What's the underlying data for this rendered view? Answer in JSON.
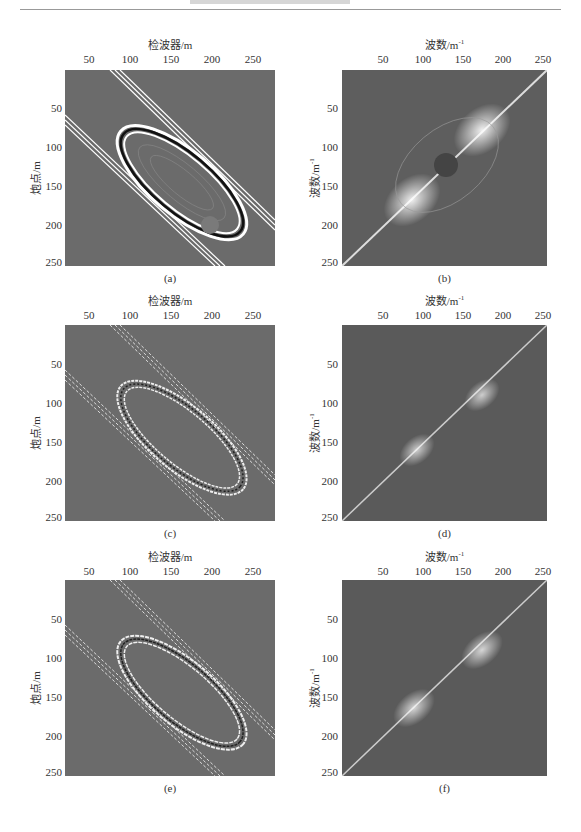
{
  "page": {
    "header_rule": true
  },
  "figure": {
    "panels": [
      {
        "id": "a",
        "caption": "(a)",
        "xlabel": "检波器/m",
        "ylabel": "炮点/m",
        "type": "shot-receiver domain",
        "xticks": [
          "50",
          "100",
          "150",
          "200",
          "250"
        ],
        "yticks": [
          "50",
          "100",
          "150",
          "200",
          "250"
        ]
      },
      {
        "id": "b",
        "caption": "(b)",
        "xlabel": "波数/m⁻¹",
        "ylabel": "波数/m⁻¹",
        "type": "wavenumber domain",
        "xticks": [
          "50",
          "100",
          "150",
          "200",
          "250"
        ],
        "yticks": [
          "50",
          "100",
          "150",
          "200",
          "250"
        ]
      },
      {
        "id": "c",
        "caption": "(c)",
        "xlabel": "检波器/m",
        "ylabel": "炮点/m",
        "type": "shot-receiver domain (noisy)",
        "xticks": [
          "50",
          "100",
          "150",
          "200",
          "250"
        ],
        "yticks": [
          "50",
          "100",
          "150",
          "200",
          "250"
        ]
      },
      {
        "id": "d",
        "caption": "(d)",
        "xlabel": "波数/m⁻¹",
        "ylabel": "波数/m⁻¹",
        "type": "wavenumber domain (noisy)",
        "xticks": [
          "50",
          "100",
          "150",
          "200",
          "250"
        ],
        "yticks": [
          "50",
          "100",
          "150",
          "200",
          "250"
        ]
      },
      {
        "id": "e",
        "caption": "(e)",
        "xlabel": "检波器/m",
        "ylabel": "炮点/m",
        "type": "shot-receiver domain (reconstructed)",
        "xticks": [
          "50",
          "100",
          "150",
          "200",
          "250"
        ],
        "yticks": [
          "50",
          "100",
          "150",
          "200",
          "250"
        ]
      },
      {
        "id": "f",
        "caption": "(f)",
        "xlabel": "波数/m⁻¹",
        "ylabel": "波数/m⁻¹",
        "type": "wavenumber domain (reconstructed)",
        "xticks": [
          "50",
          "100",
          "150",
          "200",
          "250"
        ],
        "yticks": [
          "50",
          "100",
          "150",
          "200",
          "250"
        ]
      }
    ]
  },
  "labels": {
    "a_x": "检波器/m",
    "a_y": "炮点/m",
    "a_cap": "(a)",
    "b_x": "波数/m",
    "b_y": "波数/m",
    "b_cap": "(b)",
    "c_x": "检波器/m",
    "c_y": "炮点/m",
    "c_cap": "(c)",
    "d_x": "波数/m",
    "d_y": "波数/m",
    "d_cap": "(d)",
    "e_x": "检波器/m",
    "e_y": "炮点/m",
    "e_cap": "(e)",
    "f_x": "波数/m",
    "f_y": "波数/m",
    "f_cap": "(f)",
    "sup": "-1",
    "t50": "50",
    "t100": "100",
    "t150": "150",
    "t200": "200",
    "t250": "250"
  },
  "colors": {
    "background": "#6b6b6b",
    "foreground": "#ffffff",
    "dark": "#111111"
  }
}
